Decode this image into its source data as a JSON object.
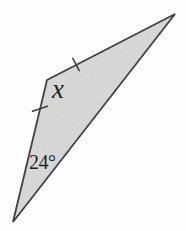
{
  "figure": {
    "background_color": "#fdfdfd",
    "shape": {
      "type": "triangle",
      "fill_color": "#d8d8d8",
      "stroke_color": "#3d3d3d",
      "vertices": [
        {
          "name": "left-obtuse-vertex",
          "x": 47,
          "y": 80
        },
        {
          "name": "top-right-vertex",
          "x": 175,
          "y": 14
        },
        {
          "name": "bottom-vertex",
          "x": 13,
          "y": 222
        }
      ]
    },
    "tick_marks": [
      {
        "on_side": "left-vertex to top-right-vertex",
        "x1": 72.8,
        "y1": 58.3,
        "x2": 79.2,
        "y2": 70.7
      },
      {
        "on_side": "left-vertex to bottom-vertex",
        "x1": 32.5,
        "y1": 111.2,
        "x2": 47.5,
        "y2": 106.3
      }
    ],
    "labels": {
      "apex_angle": "x",
      "bottom_angle": "24°",
      "text_color": "#1e1e1e"
    }
  }
}
